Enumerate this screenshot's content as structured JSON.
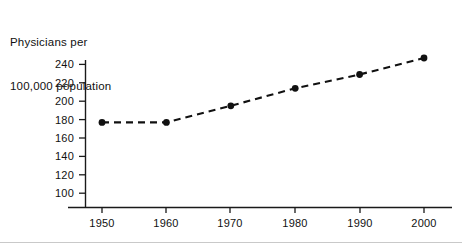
{
  "chart_data": {
    "type": "line",
    "title": "Physicians per 100,000 population",
    "title_lines": [
      "Physicians per",
      "100,000 population"
    ],
    "xlabel": "",
    "ylabel": "",
    "categories": [
      "1950",
      "1960",
      "1970",
      "1980",
      "1990",
      "2000"
    ],
    "x": [
      1950,
      1960,
      1970,
      1980,
      1990,
      2000
    ],
    "values": [
      177,
      177,
      195,
      214,
      229,
      247
    ],
    "series": [
      {
        "name": "Physicians per 100,000 population",
        "values": [
          177,
          177,
          195,
          214,
          229,
          247
        ]
      }
    ],
    "xlim": [
      1945,
      2005
    ],
    "ylim": [
      90,
      250
    ],
    "yticks": [
      100,
      120,
      140,
      160,
      180,
      200,
      220,
      240
    ],
    "ytick_labels": [
      "100",
      "120",
      "140",
      "160",
      "180",
      "200",
      "220",
      "240"
    ],
    "xticks": [
      1950,
      1960,
      1970,
      1980,
      1990,
      2000
    ],
    "xtick_labels": [
      "1950",
      "1960",
      "1970",
      "1980",
      "1990",
      "2000"
    ],
    "grid": false,
    "legend": false,
    "legend_position": "none",
    "line_style": "dashed",
    "marker": "filled-circle",
    "line_color": "#111111",
    "marker_color": "#111111",
    "axis_color": "#1a1a1a",
    "background_color": "#ffffff"
  }
}
